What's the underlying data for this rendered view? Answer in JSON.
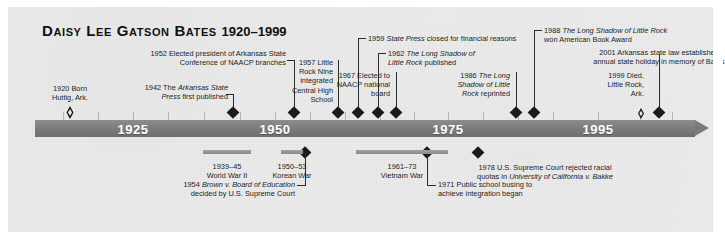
{
  "title": {
    "name": "Daisy Lee Gatson Bates",
    "years": "1920–1999"
  },
  "axis": {
    "decades": [
      {
        "label": "1925",
        "x": 133
      },
      {
        "label": "1950",
        "x": 275
      },
      {
        "label": "1975",
        "x": 448
      },
      {
        "label": "1995",
        "x": 598
      }
    ]
  },
  "events_above": [
    {
      "year": "1920",
      "lines": [
        "1920 Born",
        "Huttig, Ark."
      ],
      "align": "center",
      "marker": "hollow-diamond"
    },
    {
      "year": "1942",
      "lines": [
        "1942 The <i>Arkansas State</i>",
        "<i>Press</i> first published"
      ],
      "align": "right",
      "marker": "solid-diamond"
    },
    {
      "year": "1952",
      "lines": [
        "1952 Elected president of Arkansas State",
        "Conference of NAACP branches"
      ],
      "align": "right",
      "marker": "solid-diamond"
    },
    {
      "year": "1957",
      "lines": [
        "1957 Little",
        "Rock Nine",
        "integrated",
        "Central High",
        "School"
      ],
      "align": "right",
      "marker": "solid-diamond"
    },
    {
      "year": "1959",
      "lines": [
        "1959 <i>State Press</i> closed for financial reasons"
      ],
      "align": "left",
      "marker": "solid-diamond"
    },
    {
      "year": "1962",
      "lines": [
        "1962 <i>The Long Shadow of</i>",
        "<i>Little Rock</i> published"
      ],
      "align": "left",
      "marker": "solid-diamond"
    },
    {
      "year": "1967",
      "lines": [
        "1967 Elected to",
        "NAACP national",
        "board"
      ],
      "align": "right",
      "marker": "solid-diamond"
    },
    {
      "year": "1986",
      "lines": [
        "1986 <i>The Long</i>",
        "<i>Shadow of Little</i>",
        "<i>Rock</i> reprinted"
      ],
      "align": "right",
      "marker": "solid-diamond"
    },
    {
      "year": "1988",
      "lines": [
        "1988 <i>The Long Shadow of Little Rock</i>",
        "won American Book Award"
      ],
      "align": "left",
      "marker": "solid-diamond"
    },
    {
      "year": "1999",
      "lines": [
        "1999 Died,",
        "Little Rock,",
        "Ark."
      ],
      "align": "right",
      "marker": "hollow-diamond"
    },
    {
      "year": "2001",
      "lines": [
        "2001 Arkansas state law established",
        "annual state holiday in memory of Bates"
      ],
      "align": "center",
      "marker": "solid-diamond"
    }
  ],
  "events_below": [
    {
      "year": "1954",
      "lines": [
        "1954 <i>Brown v. Board of Education</i>",
        "decided by U.S. Supreme Court"
      ],
      "align": "right",
      "marker": "solid-diamond"
    },
    {
      "year": "1971",
      "lines": [
        "1971 Public school busing to",
        "achieve integration began"
      ],
      "align": "left",
      "marker": "solid-diamond"
    },
    {
      "year": "1978",
      "lines": [
        "1978 U.S. Supreme Court rejected racial",
        "quotas in <i>University of California v. Bakke</i>"
      ],
      "align": "center",
      "marker": "solid-diamond"
    }
  ],
  "wars": [
    {
      "range": "1939–45",
      "name": "World War II"
    },
    {
      "range": "1950–53",
      "name": "Korean War"
    },
    {
      "range": "1961–73",
      "name": "Vietnam War"
    }
  ]
}
